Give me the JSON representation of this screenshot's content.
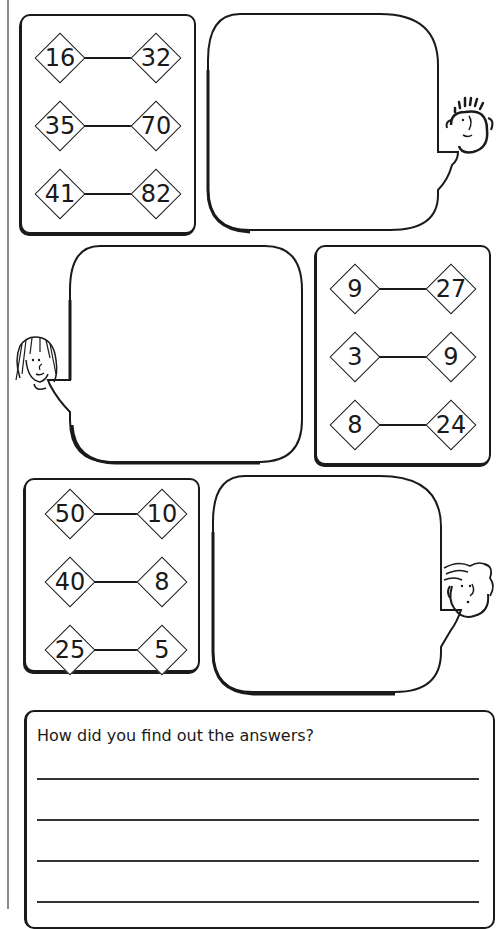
{
  "worksheet": {
    "boxes": [
      {
        "id": "box-1",
        "pairs": [
          {
            "left": "16",
            "right": "32"
          },
          {
            "left": "35",
            "right": "70"
          },
          {
            "left": "41",
            "right": "82"
          }
        ]
      },
      {
        "id": "box-2",
        "pairs": [
          {
            "left": "9",
            "right": "27"
          },
          {
            "left": "3",
            "right": "9"
          },
          {
            "left": "8",
            "right": "24"
          }
        ]
      },
      {
        "id": "box-3",
        "pairs": [
          {
            "left": "50",
            "right": "10"
          },
          {
            "left": "40",
            "right": "8"
          },
          {
            "left": "25",
            "right": "5"
          }
        ]
      }
    ],
    "speech_bubbles": [
      {
        "id": "bubble-1",
        "character": "spiky-hair-boy",
        "text": ""
      },
      {
        "id": "bubble-2",
        "character": "long-hair-girl",
        "text": ""
      },
      {
        "id": "bubble-3",
        "character": "wavy-hair-boy",
        "text": ""
      }
    ],
    "question": {
      "label": "How did you find out the answers?",
      "lines": 4
    }
  }
}
